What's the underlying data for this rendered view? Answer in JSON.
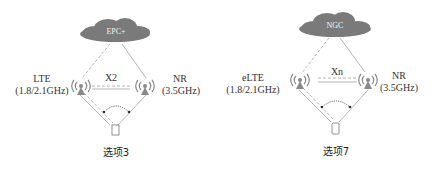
{
  "diagrams": [
    {
      "core": "EPC+",
      "left_station": {
        "name": "LTE",
        "band": "(1.8/2.1GHz)"
      },
      "right_station": {
        "name": "NR",
        "band": "(3.5GHz)"
      },
      "interface": "X2",
      "caption": "选项3"
    },
    {
      "core": "NGC",
      "left_station": {
        "name": "eLTE",
        "band": "(1.8/2.1GHz)"
      },
      "right_station": {
        "name": "NR",
        "band": "(3.5GHz)"
      },
      "interface": "Xn",
      "caption": "选项7"
    }
  ],
  "colors": {
    "cloud": "#7a7a7a",
    "line": "#b5b5b5",
    "antenna": "#888888",
    "arrow": "#444444"
  }
}
